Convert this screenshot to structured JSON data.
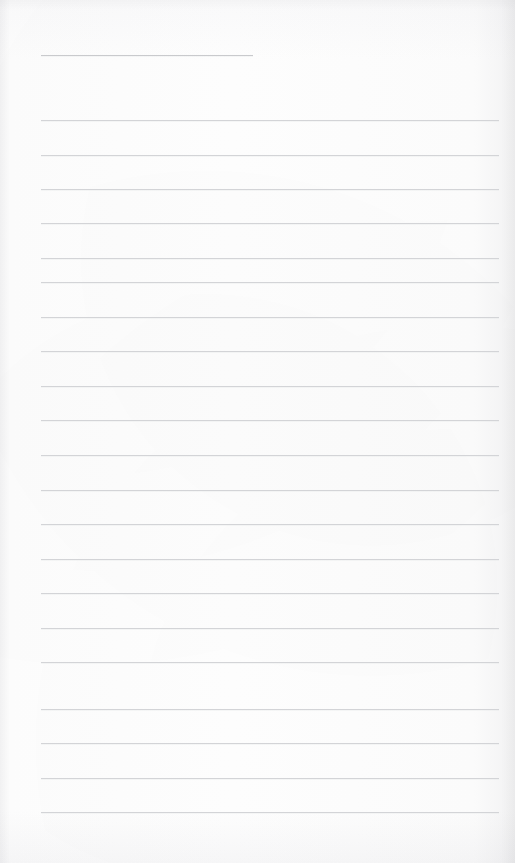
{
  "page": {
    "kind": "ruled-paper-scan",
    "width": 515,
    "height": 863,
    "background_color": "#fdfdfd",
    "content_text": "",
    "note": ""
  },
  "ruling": {
    "line_color": "#d3d4d7",
    "line_color_short": "#c9cacd",
    "line_thickness_px": 1,
    "line_spacing_px": 34.6,
    "margin_left_px": 41,
    "margin_right_px": 499,
    "total_lines": 22,
    "first_line_is_partial": true,
    "lines": [
      {
        "y": 55,
        "x1": 41,
        "x2": 253,
        "partial": true
      },
      {
        "y": 120,
        "x1": 41,
        "x2": 499,
        "partial": false
      },
      {
        "y": 155,
        "x1": 41,
        "x2": 499,
        "partial": false
      },
      {
        "y": 189,
        "x1": 41,
        "x2": 499,
        "partial": false
      },
      {
        "y": 223,
        "x1": 41,
        "x2": 499,
        "partial": false
      },
      {
        "y": 258,
        "x1": 41,
        "x2": 499,
        "partial": false
      },
      {
        "y": 282,
        "x1": 41,
        "x2": 499,
        "partial": false
      },
      {
        "y": 317,
        "x1": 41,
        "x2": 499,
        "partial": false
      },
      {
        "y": 351,
        "x1": 41,
        "x2": 499,
        "partial": false
      },
      {
        "y": 386,
        "x1": 41,
        "x2": 499,
        "partial": false
      },
      {
        "y": 420,
        "x1": 41,
        "x2": 499,
        "partial": false
      },
      {
        "y": 455,
        "x1": 41,
        "x2": 499,
        "partial": false
      },
      {
        "y": 490,
        "x1": 41,
        "x2": 499,
        "partial": false
      },
      {
        "y": 524,
        "x1": 41,
        "x2": 499,
        "partial": false
      },
      {
        "y": 559,
        "x1": 41,
        "x2": 499,
        "partial": false
      },
      {
        "y": 593,
        "x1": 41,
        "x2": 499,
        "partial": false
      },
      {
        "y": 628,
        "x1": 41,
        "x2": 499,
        "partial": false
      },
      {
        "y": 662,
        "x1": 41,
        "x2": 499,
        "partial": false
      },
      {
        "y": 709,
        "x1": 41,
        "x2": 499,
        "partial": false
      },
      {
        "y": 743,
        "x1": 41,
        "x2": 499,
        "partial": false
      },
      {
        "y": 778,
        "x1": 41,
        "x2": 499,
        "partial": false
      },
      {
        "y": 812,
        "x1": 41,
        "x2": 499,
        "partial": false
      }
    ]
  }
}
